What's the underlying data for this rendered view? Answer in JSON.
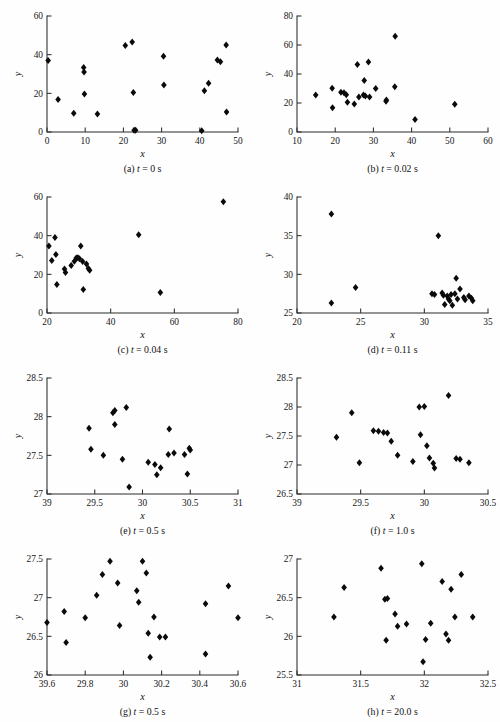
{
  "figure": {
    "axis_label_x": "x",
    "axis_label_y": "y",
    "panel_count": 8
  },
  "captions": {
    "a": "(a) t = 0 s",
    "b": "(b) t = 0.02 s",
    "c": "(c) t = 0.04 s",
    "d": "(d) t = 0.11 s",
    "e": "(e) t = 0.5 s",
    "f": "(f) t = 1.0 s",
    "g": "(g) t = 0.5 s",
    "h": "(h) t = 20.0 s"
  },
  "caption_parts": {
    "a": {
      "prefix": "(a) ",
      "var": "t",
      "suffix": " = 0 s"
    },
    "b": {
      "prefix": "(b) ",
      "var": "t",
      "suffix": " = 0.02 s"
    },
    "c": {
      "prefix": "(c) ",
      "var": "t",
      "suffix": " = 0.04 s"
    },
    "d": {
      "prefix": "(d) ",
      "var": "t",
      "suffix": " = 0.11 s"
    },
    "e": {
      "prefix": "(e) ",
      "var": "t",
      "suffix": " = 0.5 s"
    },
    "f": {
      "prefix": "(f) ",
      "var": "t",
      "suffix": " = 1.0 s"
    },
    "g": {
      "prefix": "(g) ",
      "var": "t",
      "suffix": " = 0.5 s"
    },
    "h": {
      "prefix": "(h) ",
      "var": "t",
      "suffix": " = 20.0 s"
    }
  },
  "chart_data": [
    {
      "id": "a",
      "type": "scatter",
      "title": "(a) t = 0 s",
      "xlabel": "x",
      "ylabel": "y",
      "xlim": [
        0,
        50
      ],
      "ylim": [
        0,
        60
      ],
      "xticks": [
        0,
        10,
        20,
        30,
        40,
        50
      ],
      "xticklabels": [
        "0",
        "10",
        "20",
        "30",
        "40",
        "50"
      ],
      "yticks": [
        0,
        20,
        40,
        60
      ],
      "yticklabels": [
        "0",
        "20",
        "40",
        "60"
      ],
      "grid": false,
      "legend": null,
      "marker": "filled-diamond",
      "points": [
        [
          0.3,
          37.0
        ],
        [
          2.9,
          16.8
        ],
        [
          7.0,
          9.7
        ],
        [
          9.6,
          33.3
        ],
        [
          9.7,
          31.0
        ],
        [
          9.8,
          19.6
        ],
        [
          13.2,
          9.3
        ],
        [
          20.5,
          44.7
        ],
        [
          22.3,
          46.5
        ],
        [
          22.6,
          20.4
        ],
        [
          22.8,
          0.9
        ],
        [
          23.2,
          0.9
        ],
        [
          30.5,
          39.2
        ],
        [
          30.6,
          24.3
        ],
        [
          40.5,
          0.6
        ],
        [
          41.2,
          21.4
        ],
        [
          42.3,
          25.2
        ],
        [
          44.6,
          37.3
        ],
        [
          45.4,
          36.3
        ],
        [
          46.9,
          45.0
        ],
        [
          47.0,
          10.4
        ]
      ]
    },
    {
      "id": "b",
      "type": "scatter",
      "title": "(b) t = 0.02 s",
      "xlabel": "x",
      "ylabel": "y",
      "xlim": [
        10,
        60
      ],
      "ylim": [
        0,
        80
      ],
      "xticks": [
        10,
        20,
        30,
        40,
        50,
        60
      ],
      "xticklabels": [
        "10",
        "20",
        "30",
        "40",
        "50",
        "60"
      ],
      "yticks": [
        0,
        20,
        40,
        60,
        80
      ],
      "yticklabels": [
        "0",
        "20",
        "40",
        "60",
        "80"
      ],
      "grid": false,
      "legend": null,
      "marker": "filled-diamond",
      "points": [
        [
          14.9,
          25.5
        ],
        [
          19.2,
          30.1
        ],
        [
          19.3,
          16.8
        ],
        [
          21.5,
          27.4
        ],
        [
          22.3,
          27.1
        ],
        [
          22.9,
          25.7
        ],
        [
          23.2,
          20.6
        ],
        [
          25.0,
          19.3
        ],
        [
          25.8,
          46.6
        ],
        [
          26.2,
          24.2
        ],
        [
          27.4,
          25.6
        ],
        [
          27.6,
          35.5
        ],
        [
          27.9,
          24.9
        ],
        [
          28.7,
          48.2
        ],
        [
          29.0,
          24.2
        ],
        [
          30.6,
          30.0
        ],
        [
          33.3,
          21.2
        ],
        [
          33.4,
          22.0
        ],
        [
          35.6,
          31.2
        ],
        [
          35.7,
          66.0
        ],
        [
          40.9,
          8.7
        ],
        [
          51.3,
          19.2
        ]
      ]
    },
    {
      "id": "c",
      "type": "scatter",
      "title": "(c) t = 0.04 s",
      "xlabel": "x",
      "ylabel": "y",
      "xlim": [
        20,
        80
      ],
      "ylim": [
        0,
        60
      ],
      "xticks": [
        20,
        40,
        60,
        80
      ],
      "xticklabels": [
        "20",
        "40",
        "60",
        "80"
      ],
      "yticks": [
        0,
        20,
        40,
        60
      ],
      "yticklabels": [
        "0",
        "20",
        "40",
        "60"
      ],
      "grid": false,
      "legend": null,
      "marker": "filled-diamond",
      "points": [
        [
          20.6,
          34.6
        ],
        [
          21.5,
          27.1
        ],
        [
          22.5,
          39.0
        ],
        [
          22.8,
          30.2
        ],
        [
          23.1,
          14.8
        ],
        [
          25.5,
          22.8
        ],
        [
          25.8,
          21.0
        ],
        [
          27.6,
          24.6
        ],
        [
          28.6,
          26.8
        ],
        [
          29.2,
          28.4
        ],
        [
          29.7,
          28.6
        ],
        [
          30.2,
          28.1
        ],
        [
          30.6,
          34.6
        ],
        [
          31.2,
          26.6
        ],
        [
          31.4,
          12.2
        ],
        [
          32.4,
          25.4
        ],
        [
          33.0,
          23.0
        ],
        [
          33.4,
          22.1
        ],
        [
          48.8,
          40.5
        ],
        [
          55.6,
          10.6
        ],
        [
          75.4,
          57.6
        ]
      ]
    },
    {
      "id": "d",
      "type": "scatter",
      "title": "(d) t = 0.11 s",
      "xlabel": "x",
      "ylabel": "y",
      "xlim": [
        20,
        35
      ],
      "ylim": [
        25,
        40
      ],
      "xticks": [
        20,
        25,
        30,
        35
      ],
      "xticklabels": [
        "20",
        "25",
        "30",
        "35"
      ],
      "yticks": [
        25,
        30,
        35,
        40
      ],
      "yticklabels": [
        "25",
        "30",
        "35",
        "40"
      ],
      "grid": false,
      "legend": null,
      "marker": "filled-diamond",
      "points": [
        [
          22.7,
          26.3
        ],
        [
          22.7,
          37.8
        ],
        [
          24.6,
          28.3
        ],
        [
          30.6,
          27.5
        ],
        [
          30.8,
          27.4
        ],
        [
          31.1,
          35.0
        ],
        [
          31.4,
          27.6
        ],
        [
          31.5,
          27.3
        ],
        [
          31.6,
          26.1
        ],
        [
          31.8,
          27.2
        ],
        [
          31.9,
          26.8
        ],
        [
          32.0,
          26.6
        ],
        [
          32.1,
          27.4
        ],
        [
          32.2,
          26.0
        ],
        [
          32.4,
          27.5
        ],
        [
          32.5,
          29.5
        ],
        [
          32.6,
          26.8
        ],
        [
          32.8,
          28.1
        ],
        [
          33.1,
          27.0
        ],
        [
          33.2,
          26.7
        ],
        [
          33.5,
          27.2
        ],
        [
          33.7,
          26.9
        ],
        [
          33.8,
          26.6
        ]
      ]
    },
    {
      "id": "e",
      "type": "scatter",
      "title": "(e) t = 0.5 s",
      "xlabel": "x",
      "ylabel": "y",
      "xlim": [
        29,
        31
      ],
      "ylim": [
        27,
        28.5
      ],
      "xticks": [
        29,
        29.5,
        30,
        30.5,
        31
      ],
      "xticklabels": [
        "39",
        "29.5",
        "30",
        "30.5",
        "31"
      ],
      "yticks": [
        27,
        27.5,
        28,
        28.5
      ],
      "yticklabels": [
        "27",
        "27.5",
        "28",
        "28.5"
      ],
      "grid": false,
      "legend": null,
      "marker": "filled-diamond",
      "points": [
        [
          29.44,
          27.85
        ],
        [
          29.46,
          27.58
        ],
        [
          29.59,
          27.5
        ],
        [
          29.69,
          28.05
        ],
        [
          29.71,
          28.08
        ],
        [
          29.71,
          27.9
        ],
        [
          29.79,
          27.45
        ],
        [
          29.83,
          28.12
        ],
        [
          29.86,
          27.09
        ],
        [
          30.06,
          27.41
        ],
        [
          30.13,
          27.38
        ],
        [
          30.15,
          27.25
        ],
        [
          30.19,
          27.34
        ],
        [
          30.27,
          27.51
        ],
        [
          30.28,
          27.84
        ],
        [
          30.33,
          27.53
        ],
        [
          30.44,
          27.51
        ],
        [
          30.47,
          27.26
        ],
        [
          30.49,
          27.59
        ],
        [
          30.5,
          27.57
        ]
      ]
    },
    {
      "id": "f",
      "type": "scatter",
      "title": "(f) t = 1.0 s",
      "xlabel": "x",
      "ylabel": "y",
      "xlim": [
        29,
        30.5
      ],
      "ylim": [
        26.5,
        28.5
      ],
      "xticks": [
        29,
        29.5,
        30,
        30.5
      ],
      "xticklabels": [
        "39",
        "29.5",
        "30",
        "30.5"
      ],
      "yticks": [
        26.5,
        27,
        27.5,
        28,
        28.5
      ],
      "yticklabels": [
        "26.5",
        "27",
        "27.5",
        "28",
        "28.5"
      ],
      "grid": false,
      "legend": null,
      "marker": "filled-diamond",
      "points": [
        [
          29.31,
          27.48
        ],
        [
          29.43,
          27.9
        ],
        [
          29.49,
          27.04
        ],
        [
          29.6,
          27.59
        ],
        [
          29.64,
          27.58
        ],
        [
          29.68,
          27.56
        ],
        [
          29.71,
          27.55
        ],
        [
          29.74,
          27.41
        ],
        [
          29.79,
          27.17
        ],
        [
          29.91,
          27.06
        ],
        [
          29.96,
          28.0
        ],
        [
          30.0,
          28.01
        ],
        [
          29.97,
          27.52
        ],
        [
          30.02,
          27.33
        ],
        [
          30.04,
          27.12
        ],
        [
          30.07,
          27.03
        ],
        [
          30.08,
          26.95
        ],
        [
          30.19,
          28.2
        ],
        [
          30.25,
          27.11
        ],
        [
          30.28,
          27.1
        ],
        [
          30.35,
          27.04
        ]
      ]
    },
    {
      "id": "g",
      "type": "scatter",
      "title": "(g) t = 0.5 s",
      "xlabel": "x",
      "ylabel": "y",
      "xlim": [
        29.6,
        30.6
      ],
      "ylim": [
        26,
        27.5
      ],
      "xticks": [
        29.6,
        29.8,
        30,
        30.2,
        30.4,
        30.6
      ],
      "xticklabels": [
        "39.6",
        "29.8",
        "30",
        "30.2",
        "30.4",
        "30.6"
      ],
      "yticks": [
        26,
        26.5,
        27,
        27.5
      ],
      "yticklabels": [
        "26",
        "26.5",
        "27",
        "27.5"
      ],
      "grid": false,
      "legend": null,
      "marker": "filled-diamond",
      "points": [
        [
          29.6,
          26.68
        ],
        [
          29.69,
          26.82
        ],
        [
          29.7,
          26.42
        ],
        [
          29.8,
          26.74
        ],
        [
          29.86,
          27.03
        ],
        [
          29.89,
          27.3
        ],
        [
          29.93,
          27.47
        ],
        [
          29.97,
          27.19
        ],
        [
          29.98,
          26.64
        ],
        [
          30.07,
          27.09
        ],
        [
          30.08,
          26.94
        ],
        [
          30.1,
          27.47
        ],
        [
          30.12,
          27.32
        ],
        [
          30.13,
          26.54
        ],
        [
          30.14,
          26.23
        ],
        [
          30.16,
          26.75
        ],
        [
          30.19,
          26.49
        ],
        [
          30.22,
          26.49
        ],
        [
          30.43,
          26.92
        ],
        [
          30.43,
          26.27
        ],
        [
          30.55,
          27.15
        ],
        [
          30.6,
          26.74
        ]
      ]
    },
    {
      "id": "h",
      "type": "scatter",
      "title": "(h) t = 20.0 s",
      "xlabel": "x",
      "ylabel": "y",
      "xlim": [
        31,
        32.5
      ],
      "ylim": [
        25.5,
        27
      ],
      "xticks": [
        31,
        31.5,
        32,
        32.5
      ],
      "xticklabels": [
        "31",
        "31.5",
        "32",
        "32.5"
      ],
      "yticks": [
        25.5,
        26,
        26.5,
        27
      ],
      "yticklabels": [
        "25.5",
        "26",
        "26.5",
        "27"
      ],
      "grid": false,
      "legend": null,
      "marker": "filled-diamond",
      "points": [
        [
          31.29,
          26.25
        ],
        [
          31.37,
          26.63
        ],
        [
          31.66,
          26.88
        ],
        [
          31.69,
          26.48
        ],
        [
          31.71,
          26.49
        ],
        [
          31.7,
          25.95
        ],
        [
          31.77,
          26.29
        ],
        [
          31.79,
          26.13
        ],
        [
          31.86,
          26.16
        ],
        [
          31.99,
          25.67
        ],
        [
          31.98,
          26.94
        ],
        [
          32.01,
          25.96
        ],
        [
          32.05,
          26.17
        ],
        [
          32.14,
          26.71
        ],
        [
          32.17,
          26.03
        ],
        [
          32.19,
          25.95
        ],
        [
          32.21,
          26.61
        ],
        [
          32.24,
          26.25
        ],
        [
          32.29,
          26.8
        ],
        [
          32.38,
          26.25
        ]
      ]
    }
  ],
  "colors": {
    "marker": "#0a0a0a",
    "axis": "#2b2b2b",
    "text": "#111111",
    "background": "#fefefe"
  }
}
